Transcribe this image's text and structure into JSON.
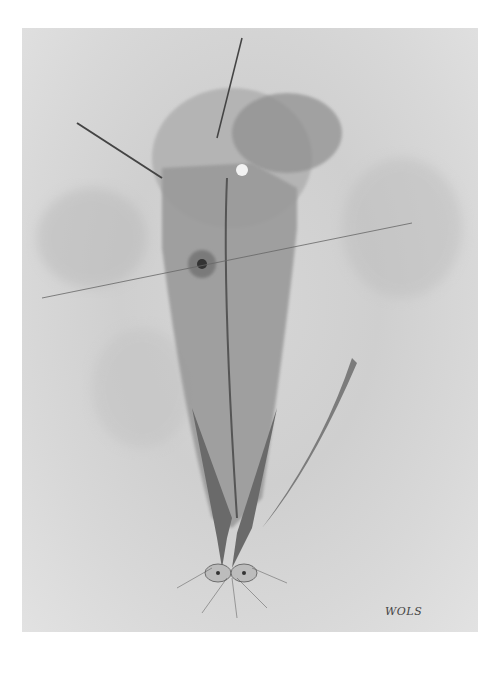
{
  "artwork": {
    "signature": "WOLS",
    "palette": {
      "background": "#ffffff",
      "paper": "#d4d4d4",
      "wash_dark": "#8a8a8a",
      "wash_mid": "#a8a8a8",
      "ink": "#3a3a3a"
    }
  }
}
